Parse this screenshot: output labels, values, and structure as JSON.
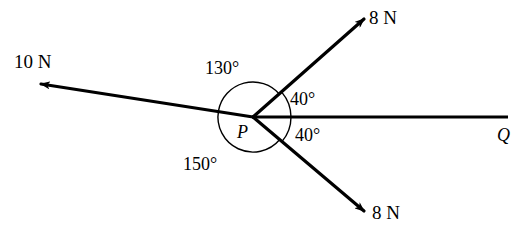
{
  "figure": {
    "type": "force-vector-diagram",
    "vertex_label": "P",
    "ray_end_label": "Q",
    "stroke_color": "#000000",
    "background_color": "#ffffff"
  },
  "forces": [
    {
      "id": "force-up-right",
      "label": "8 N",
      "magnitude": 8,
      "unit": "N",
      "direction_deg": 40
    },
    {
      "id": "force-left",
      "label": "10 N",
      "magnitude": 10,
      "unit": "N",
      "direction_deg": 170
    },
    {
      "id": "force-down-right",
      "label": "8 N",
      "magnitude": 8,
      "unit": "N",
      "direction_deg": -40
    }
  ],
  "angles": [
    {
      "id": "angle-upper-40",
      "label": "40°",
      "value": 40
    },
    {
      "id": "angle-lower-40",
      "label": "40°",
      "value": 40
    },
    {
      "id": "angle-130",
      "label": "130°",
      "value": 130
    },
    {
      "id": "angle-150",
      "label": "150°",
      "value": 150
    }
  ],
  "labels": {
    "force_up_right": "8 N",
    "force_left": "10 N",
    "force_down_right": "8 N",
    "angle_upper_40": "40°",
    "angle_lower_40": "40°",
    "angle_130": "130°",
    "angle_150": "150°",
    "vertex": "P",
    "ray_q": "Q"
  }
}
